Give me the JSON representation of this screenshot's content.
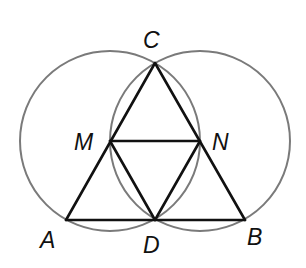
{
  "diagram": {
    "width": 306,
    "height": 268,
    "colors": {
      "background": "#ffffff",
      "circle_stroke": "#7a7a7a",
      "segment_stroke": "#111111",
      "label": "#111111"
    },
    "points": {
      "A": {
        "x": 66,
        "y": 220
      },
      "B": {
        "x": 245,
        "y": 220
      },
      "C": {
        "x": 155,
        "y": 63
      },
      "D": {
        "x": 155,
        "y": 220
      },
      "M": {
        "x": 110,
        "y": 141
      },
      "N": {
        "x": 200,
        "y": 141
      }
    },
    "circles": [
      {
        "name": "circle-centered-M",
        "center": "M",
        "cx": 110,
        "cy": 141,
        "r": 90
      },
      {
        "name": "circle-centered-N",
        "center": "N",
        "cx": 200,
        "cy": 141,
        "r": 90
      }
    ],
    "segments": [
      [
        "A",
        "B"
      ],
      [
        "A",
        "C"
      ],
      [
        "B",
        "C"
      ],
      [
        "M",
        "N"
      ],
      [
        "M",
        "D"
      ],
      [
        "N",
        "D"
      ]
    ],
    "labels": [
      {
        "text": "C",
        "x": 143,
        "y": 48
      },
      {
        "text": "M",
        "x": 74,
        "y": 150
      },
      {
        "text": "N",
        "x": 212,
        "y": 150
      },
      {
        "text": "A",
        "x": 40,
        "y": 248
      },
      {
        "text": "D",
        "x": 143,
        "y": 253
      },
      {
        "text": "B",
        "x": 247,
        "y": 245
      }
    ]
  }
}
